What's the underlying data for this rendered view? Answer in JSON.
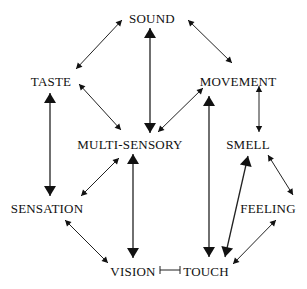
{
  "diagram": {
    "nodes": [
      {
        "id": "sound",
        "label": "SOUND",
        "x": 152,
        "y": 19
      },
      {
        "id": "taste",
        "label": "TASTE",
        "x": 51,
        "y": 82
      },
      {
        "id": "movement",
        "label": "MOVEMENT",
        "x": 238,
        "y": 82
      },
      {
        "id": "multi",
        "label": "MULTI-SENSORY",
        "x": 130,
        "y": 145
      },
      {
        "id": "smell",
        "label": "SMELL",
        "x": 248,
        "y": 145
      },
      {
        "id": "sensation",
        "label": "SENSATION",
        "x": 47,
        "y": 209
      },
      {
        "id": "feeling",
        "label": "FEELING",
        "x": 268,
        "y": 209
      },
      {
        "id": "vision",
        "label": "VISION",
        "x": 133,
        "y": 272
      },
      {
        "id": "touch",
        "label": "TOUCH",
        "x": 206,
        "y": 272
      }
    ],
    "edges": [
      {
        "from": "sound",
        "to": "taste",
        "x1": 122,
        "y1": 20,
        "x2": 76,
        "y2": 69,
        "style": "thin"
      },
      {
        "from": "sound",
        "to": "movement",
        "x1": 188,
        "y1": 20,
        "x2": 232,
        "y2": 63,
        "style": "thin"
      },
      {
        "from": "sound",
        "to": "multi",
        "x1": 150,
        "y1": 28,
        "x2": 150,
        "y2": 133,
        "style": "bold"
      },
      {
        "from": "taste",
        "to": "multi",
        "x1": 79,
        "y1": 84,
        "x2": 121,
        "y2": 130,
        "style": "thin"
      },
      {
        "from": "movement",
        "to": "multi",
        "x1": 203,
        "y1": 88,
        "x2": 158,
        "y2": 132,
        "style": "thin"
      },
      {
        "from": "taste",
        "to": "sensation",
        "x1": 50,
        "y1": 93,
        "x2": 50,
        "y2": 196,
        "style": "bold"
      },
      {
        "from": "movement",
        "to": "touch",
        "x1": 209,
        "y1": 96,
        "x2": 209,
        "y2": 257,
        "style": "bold"
      },
      {
        "from": "movement",
        "to": "smell",
        "x1": 259,
        "y1": 86,
        "x2": 259,
        "y2": 132,
        "style": "thin"
      },
      {
        "from": "multi",
        "to": "sensation",
        "x1": 119,
        "y1": 158,
        "x2": 81,
        "y2": 196,
        "style": "thin"
      },
      {
        "from": "multi",
        "to": "vision",
        "x1": 133,
        "y1": 154,
        "x2": 133,
        "y2": 258,
        "style": "bold"
      },
      {
        "from": "smell",
        "to": "touch",
        "x1": 248,
        "y1": 156,
        "x2": 225,
        "y2": 257,
        "style": "bold"
      },
      {
        "from": "smell",
        "to": "feeling",
        "x1": 268,
        "y1": 155,
        "x2": 293,
        "y2": 195,
        "style": "thin"
      },
      {
        "from": "sensation",
        "to": "vision",
        "x1": 65,
        "y1": 220,
        "x2": 108,
        "y2": 263,
        "style": "thin"
      },
      {
        "from": "feeling",
        "to": "touch",
        "x1": 276,
        "y1": 220,
        "x2": 233,
        "y2": 264,
        "style": "thin"
      },
      {
        "from": "vision",
        "to": "touch",
        "x1": 160,
        "y1": 270,
        "x2": 180,
        "y2": 270,
        "style": "bar"
      }
    ]
  }
}
